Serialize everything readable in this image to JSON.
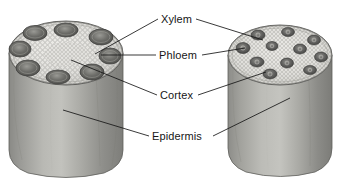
{
  "figure": {
    "background_color": "#ffffff",
    "ink_color": "#161616"
  },
  "labels": [
    {
      "id": "xylem",
      "text": "Xylem",
      "x": 161,
      "y": 13
    },
    {
      "id": "phloem",
      "text": "Phloem",
      "x": 159,
      "y": 49
    },
    {
      "id": "cortex",
      "text": "Cortex",
      "x": 160,
      "y": 89
    },
    {
      "id": "epidermis",
      "text": "Epidermis",
      "x": 152,
      "y": 130
    }
  ],
  "specimens": [
    {
      "id": "dicot-stem",
      "name": "Dicot stem cylinder",
      "arrangement": "ring",
      "bundle_count": 8,
      "top_face_color": "#e3e2de",
      "body_color": "#9d9d99"
    },
    {
      "id": "monocot-stem",
      "name": "Monocot stem cylinder",
      "arrangement": "scattered",
      "bundle_count": 11,
      "top_face_color": "#e6e5e1",
      "body_color": "#a2a29e"
    }
  ],
  "leaders": [
    {
      "id": "xylem-left",
      "from_label": "xylem",
      "to_specimen": "dicot-stem"
    },
    {
      "id": "xylem-right",
      "from_label": "xylem",
      "to_specimen": "monocot-stem"
    },
    {
      "id": "phloem-left",
      "from_label": "phloem",
      "to_specimen": "dicot-stem"
    },
    {
      "id": "phloem-right",
      "from_label": "phloem",
      "to_specimen": "monocot-stem"
    },
    {
      "id": "cortex-left",
      "from_label": "cortex",
      "to_specimen": "dicot-stem"
    },
    {
      "id": "cortex-right",
      "from_label": "cortex",
      "to_specimen": "monocot-stem"
    },
    {
      "id": "epidermis-left",
      "from_label": "epidermis",
      "to_specimen": "dicot-stem"
    },
    {
      "id": "epidermis-right",
      "from_label": "epidermis",
      "to_specimen": "monocot-stem"
    }
  ]
}
